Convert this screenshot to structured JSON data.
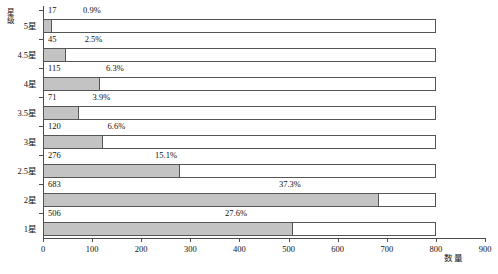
{
  "chart_data": {
    "type": "bar",
    "orientation": "horizontal",
    "title": "",
    "xlabel": "数量",
    "ylabel": "星级",
    "xlim": [
      0,
      900
    ],
    "xticks": [
      0,
      100,
      200,
      300,
      400,
      500,
      600,
      700,
      800,
      900
    ],
    "grid": false,
    "legend": "none",
    "bar_track_max": 800,
    "categories": [
      "5星",
      "4.5星",
      "4星",
      "3.5星",
      "3星",
      "2.5星",
      "2星",
      "1星"
    ],
    "values": [
      17,
      45,
      115,
      71,
      120,
      276,
      683,
      506
    ],
    "percent_labels": [
      "0.9%",
      "2.5%",
      "6.3%",
      "3.9%",
      "6.6%",
      "15.1%",
      "37.3%",
      "27.6%"
    ],
    "value_labels": [
      "17",
      "45",
      "115",
      "71",
      "120",
      "276",
      "683",
      "506"
    ],
    "series": [
      {
        "name": "数量",
        "values": [
          17,
          45,
          115,
          71,
          120,
          276,
          683,
          506
        ]
      }
    ],
    "colors": {
      "bar_fill": "#c3c3c3",
      "bar_border": "#555555",
      "axis": "#4d4d4d",
      "text": "#111111"
    },
    "rows": [
      {
        "category": "5星",
        "value": 17,
        "value_label": "17",
        "percent": "0.9%"
      },
      {
        "category": "4.5星",
        "value": 45,
        "value_label": "45",
        "percent": "2.5%"
      },
      {
        "category": "4星",
        "value": 115,
        "value_label": "115",
        "percent": "6.3%"
      },
      {
        "category": "3.5星",
        "value": 71,
        "value_label": "71",
        "percent": "3.9%"
      },
      {
        "category": "3星",
        "value": 120,
        "value_label": "120",
        "percent": "6.6%"
      },
      {
        "category": "2.5星",
        "value": 276,
        "value_label": "276",
        "percent": "15.1%"
      },
      {
        "category": "2星",
        "value": 683,
        "value_label": "683",
        "percent": "37.3%"
      },
      {
        "category": "1星",
        "value": 506,
        "value_label": "506",
        "percent": "27.6%"
      }
    ]
  }
}
